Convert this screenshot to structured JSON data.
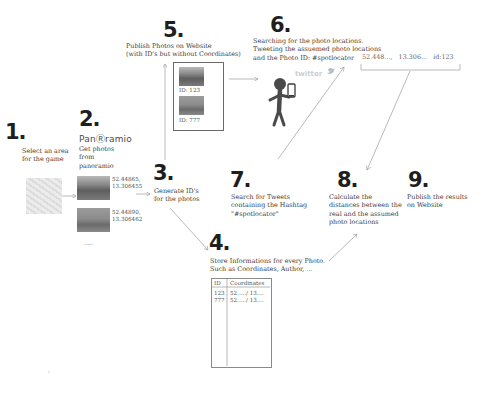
{
  "steps": {
    "s1": {
      "number": "1.",
      "text": "Select an area\nfor the game"
    },
    "s2": {
      "number": "2.",
      "logo": "PanⓇramio",
      "text": "Get photos\nfrom\npanoramio",
      "photos": [
        {
          "coords": "52.44865,\n13.306455"
        },
        {
          "coords": "52.44890,\n13.306462"
        }
      ],
      "more": "....."
    },
    "s3": {
      "number": "3.",
      "text": "Generate ID's\nfor the photos"
    },
    "s4": {
      "number": "4.",
      "text": "Store Informations for every Photo.\nSuch as Coordinates, Author, ...",
      "table": {
        "headers": [
          "ID",
          "Coordinates"
        ],
        "rows": [
          [
            "123",
            "52...../ 13...."
          ],
          [
            "777",
            "52...../ 13...."
          ]
        ]
      }
    },
    "s5": {
      "number": "5.",
      "text": "Publish Photos on Website\n(with ID's but without Coordinates)",
      "photos": [
        {
          "label": "ID: 123"
        },
        {
          "label": "ID: 777"
        }
      ]
    },
    "s6": {
      "number": "6.",
      "text": "Searching for the photo locations.\nTweeting the assuemed photo locations\nand the Photo ID: #spotlocator",
      "tweet": "52.448...,   13.306...   id:123",
      "twitter_label": "twitter"
    },
    "s7": {
      "number": "7.",
      "text": "Search for Tweets\ncontaining the Hashtag\n\"#spotlocator\""
    },
    "s8": {
      "number": "8.",
      "text": "Calculate the\ndistances between the\nreal and the assumed\nphoto locations"
    },
    "s9": {
      "number": "9.",
      "text": "Publish the results\non Website"
    }
  },
  "colors": {
    "number": "#1e1e1e",
    "text": "#3d3d3d",
    "arrow": "#a8a8a8",
    "figure": "#4a4a4a"
  }
}
